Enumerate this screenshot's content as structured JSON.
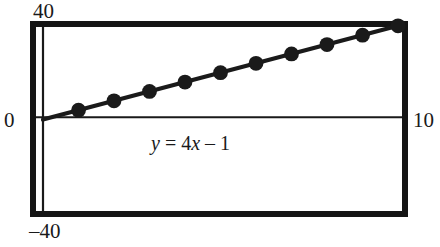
{
  "figure": {
    "title": "",
    "equation": {
      "lhs": "y",
      "eq": "=",
      "slope": "4",
      "xvar": "x",
      "minus": "–",
      "intercept": "1",
      "full": "y = 4x – 1"
    },
    "labels": {
      "y_max": "40",
      "y_min": "–40",
      "x_min": "0",
      "x_max": "10"
    },
    "colors": {
      "frame": "#151515",
      "axis": "#1a1a1a",
      "line": "#1a1a1a",
      "marker": "#1a1a1a",
      "background": "#ffffff"
    }
  },
  "chart_data": {
    "type": "line",
    "title": "",
    "xlabel": "",
    "ylabel": "",
    "xlim": [
      0,
      10
    ],
    "ylim": [
      -40,
      40
    ],
    "grid": false,
    "legend": null,
    "annotations": [
      {
        "text": "y = 4x – 1",
        "x": 5,
        "y": -10
      }
    ],
    "tick_labels": {
      "x": [
        "0",
        "10"
      ],
      "y": [
        "–40",
        "40"
      ]
    },
    "series": [
      {
        "name": "y = 4x - 1",
        "equation": "y = 4x - 1",
        "slope": 4,
        "intercept": -1,
        "marker": "circle",
        "line_from": {
          "x": 0,
          "y": -1
        },
        "line_to": {
          "x": 10,
          "y": 39
        },
        "x": [
          1,
          2,
          3,
          4,
          5,
          6,
          7,
          8,
          9,
          10
        ],
        "values": [
          3,
          7,
          11,
          15,
          19,
          23,
          27,
          31,
          35,
          39
        ]
      }
    ]
  }
}
